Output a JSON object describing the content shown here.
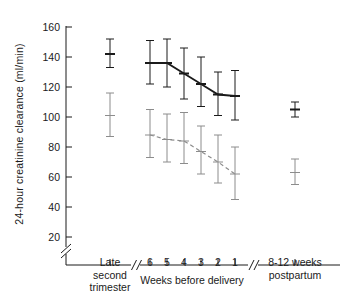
{
  "chart_data": {
    "type": "line",
    "title": "",
    "xlabel": "Weeks before delivery",
    "ylabel": "24-hour creatinine clearance (ml/min)",
    "ylim": [
      0,
      165
    ],
    "yticks": [
      20,
      40,
      60,
      80,
      100,
      120,
      140,
      160
    ],
    "ytick_labels": [
      "20",
      "40",
      "60",
      "80",
      "100",
      "120",
      "140",
      "160"
    ],
    "y_axis_break": true,
    "x_axis_breaks": 2,
    "grid": false,
    "legend": false,
    "x_categories": [
      "Late second trimester",
      "6",
      "5",
      "4",
      "3",
      "2",
      "1",
      "8-12 weeks postpartum"
    ],
    "x_group_labels": [
      {
        "text_line1": "Late",
        "text_line2": "second",
        "text_line3": "trimester"
      },
      {
        "text_line1": "Weeks before delivery"
      },
      {
        "text_line1": "8-12 weeks",
        "text_line2": "postpartum"
      }
    ],
    "series": [
      {
        "name": "upper-series",
        "style": "solid",
        "color": "#1a1a1a",
        "points": [
          {
            "x_label": "Late second trimester",
            "mean": 142,
            "low": 133,
            "high": 152,
            "connected": false
          },
          {
            "x_label": "6",
            "mean": 136,
            "low": 122,
            "high": 151,
            "connected": true
          },
          {
            "x_label": "5",
            "mean": 136,
            "low": 120,
            "high": 152,
            "connected": true
          },
          {
            "x_label": "4",
            "mean": 129,
            "low": 112,
            "high": 146,
            "connected": true
          },
          {
            "x_label": "3",
            "mean": 122,
            "low": 107,
            "high": 140,
            "connected": true
          },
          {
            "x_label": "2",
            "mean": 115,
            "low": 101,
            "high": 130,
            "connected": true
          },
          {
            "x_label": "1",
            "mean": 114,
            "low": 98,
            "high": 131,
            "connected": true
          },
          {
            "x_label": "8-12 weeks postpartum",
            "mean": 105,
            "low": 100,
            "high": 110,
            "connected": false
          }
        ]
      },
      {
        "name": "lower-series",
        "style": "dashed",
        "color": "#8c8c8c",
        "points": [
          {
            "x_label": "Late second trimester",
            "mean": 101,
            "low": 87,
            "high": 116,
            "connected": false
          },
          {
            "x_label": "6",
            "mean": 88,
            "low": 73,
            "high": 105,
            "connected": true
          },
          {
            "x_label": "5",
            "mean": 85,
            "low": 70,
            "high": 102,
            "connected": true
          },
          {
            "x_label": "4",
            "mean": 84,
            "low": 69,
            "high": 103,
            "connected": true
          },
          {
            "x_label": "3",
            "mean": 77,
            "low": 62,
            "high": 94,
            "connected": true
          },
          {
            "x_label": "2",
            "mean": 70,
            "low": 56,
            "high": 88,
            "connected": true
          },
          {
            "x_label": "1",
            "mean": 62,
            "low": 45,
            "high": 80,
            "connected": true
          },
          {
            "x_label": "8-12 weeks postpartum",
            "mean": 63,
            "low": 55,
            "high": 72,
            "connected": false
          }
        ]
      }
    ],
    "colors": {
      "axis": "#1a1a1a",
      "upper_series": "#1a1a1a",
      "lower_series": "#8c8c8c",
      "background": "#ffffff"
    }
  }
}
